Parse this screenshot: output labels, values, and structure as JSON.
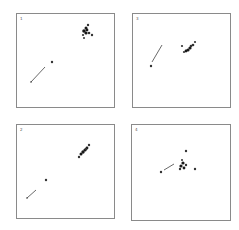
{
  "figure": {
    "width": 239,
    "height": 230,
    "colors": {
      "frame": "#8a8a8a",
      "points": "#222222",
      "background": "#ffffff"
    },
    "panels": [
      {
        "label": "1",
        "frame": {
          "x": 16,
          "y": 13,
          "w": 98,
          "h": 94
        },
        "arrow": {
          "x1": 31,
          "y1": 82,
          "x2": 45,
          "y2": 67
        },
        "points": [
          {
            "x": 31,
            "y": 82,
            "r": 0.8
          },
          {
            "x": 52,
            "y": 62,
            "r": 1.2
          },
          {
            "x": 88,
            "y": 25,
            "r": 1.2
          },
          {
            "x": 86,
            "y": 28,
            "r": 1.5
          },
          {
            "x": 84,
            "y": 31,
            "r": 1.8
          },
          {
            "x": 86,
            "y": 33,
            "r": 1.6
          },
          {
            "x": 89,
            "y": 33,
            "r": 1.3
          },
          {
            "x": 92,
            "y": 35,
            "r": 1.2
          },
          {
            "x": 83,
            "y": 35,
            "r": 1.1
          },
          {
            "x": 84,
            "y": 38,
            "r": 1.0
          },
          {
            "x": 87,
            "y": 30,
            "r": 1.4
          }
        ]
      },
      {
        "label": "3",
        "frame": {
          "x": 132,
          "y": 13,
          "w": 98,
          "h": 94
        },
        "arrow": {
          "x1": 152,
          "y1": 62,
          "x2": 162,
          "y2": 45
        },
        "points": [
          {
            "x": 151,
            "y": 66,
            "r": 1.2
          },
          {
            "x": 182,
            "y": 46,
            "r": 1.1
          },
          {
            "x": 195,
            "y": 42,
            "r": 1.1
          },
          {
            "x": 193,
            "y": 45,
            "r": 1.3
          },
          {
            "x": 190,
            "y": 48,
            "r": 1.6
          },
          {
            "x": 188,
            "y": 50,
            "r": 1.6
          },
          {
            "x": 186,
            "y": 51,
            "r": 1.4
          },
          {
            "x": 184,
            "y": 52,
            "r": 1.1
          },
          {
            "x": 191,
            "y": 46,
            "r": 1.3
          }
        ]
      },
      {
        "label": "2",
        "frame": {
          "x": 16,
          "y": 124,
          "w": 98,
          "h": 94
        },
        "arrow": {
          "x1": 27,
          "y1": 198,
          "x2": 36,
          "y2": 190
        },
        "points": [
          {
            "x": 27,
            "y": 198,
            "r": 0.8
          },
          {
            "x": 46,
            "y": 180,
            "r": 1.2
          },
          {
            "x": 89,
            "y": 145,
            "r": 1.2
          },
          {
            "x": 87,
            "y": 148,
            "r": 1.4
          },
          {
            "x": 85,
            "y": 150,
            "r": 1.6
          },
          {
            "x": 83,
            "y": 152,
            "r": 1.7
          },
          {
            "x": 81,
            "y": 154,
            "r": 1.5
          },
          {
            "x": 79,
            "y": 157,
            "r": 1.2
          },
          {
            "x": 86,
            "y": 149,
            "r": 1.3
          }
        ]
      },
      {
        "label": "4",
        "frame": {
          "x": 131,
          "y": 124,
          "w": 99,
          "h": 96
        },
        "arrow": {
          "x1": 164,
          "y1": 170,
          "x2": 174,
          "y2": 164
        },
        "points": [
          {
            "x": 161,
            "y": 172,
            "r": 1.2
          },
          {
            "x": 186,
            "y": 151,
            "r": 1.2
          },
          {
            "x": 195,
            "y": 169,
            "r": 1.2
          },
          {
            "x": 183,
            "y": 163,
            "r": 1.6
          },
          {
            "x": 181,
            "y": 166,
            "r": 1.6
          },
          {
            "x": 184,
            "y": 168,
            "r": 1.4
          },
          {
            "x": 180,
            "y": 169,
            "r": 1.2
          },
          {
            "x": 186,
            "y": 165,
            "r": 1.2
          },
          {
            "x": 182,
            "y": 160,
            "r": 1.0
          }
        ]
      }
    ]
  }
}
